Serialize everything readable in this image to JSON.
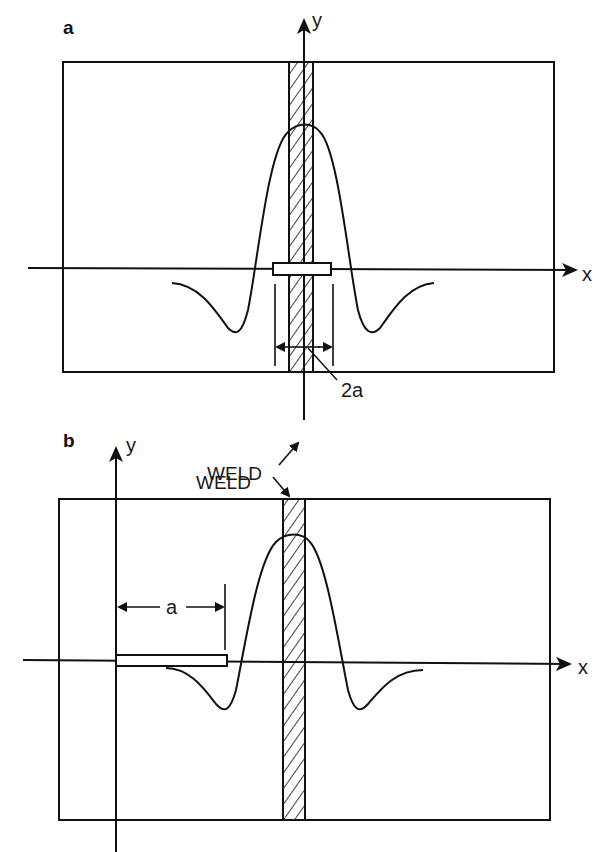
{
  "figure": {
    "panels": [
      {
        "id": "a",
        "label": "a",
        "axis_x_label": "x",
        "axis_y_label": "y",
        "weld_label": "WELD",
        "crack_dimension_label": "2a",
        "description": "Centre crack of length 2a across the weld, stress distribution symmetric about weld centreline"
      },
      {
        "id": "b",
        "label": "b",
        "axis_x_label": "x",
        "axis_y_label": "y",
        "weld_label": "WELD",
        "crack_dimension_label": "a",
        "description": "Edge crack of length a from plate edge, weld offset from crack"
      }
    ],
    "colors": {
      "line": "#111111",
      "background": "#ffffff"
    }
  }
}
